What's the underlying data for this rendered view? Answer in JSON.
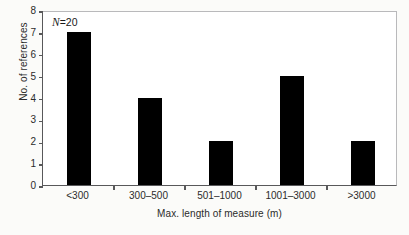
{
  "chart_data": {
    "type": "bar",
    "title": "",
    "subtitle": "",
    "categories": [
      "<300",
      "300–500",
      "501–1000",
      "1001–3000",
      ">3000"
    ],
    "values": [
      7,
      4,
      2,
      5,
      2
    ],
    "series": [
      {
        "name": "No. of references",
        "values": [
          7,
          4,
          2,
          5,
          2
        ]
      }
    ],
    "xlabel": "Max. length of measure (m)",
    "ylabel": "No. of references",
    "ylim": [
      0,
      8
    ],
    "yticks": [
      0,
      1,
      2,
      3,
      4,
      5,
      6,
      7,
      8
    ],
    "ytick_labels": [
      "0",
      "1",
      "2",
      "3",
      "4",
      "5",
      "6",
      "7",
      "8"
    ],
    "grid": false,
    "legend": false,
    "legend_position": "none",
    "annotations": [
      {
        "name": "sample-size",
        "symbol": "N",
        "equals": "=",
        "value": "20",
        "text": "N = 20",
        "position": "top-left-inside"
      }
    ],
    "colors": {
      "bar_fill": "#000000",
      "axis": "#58585a",
      "frame_light": "#b9b9bb",
      "plot_background": "#ffffff",
      "figure_background": "#fbfbf9",
      "text": "#2b2b2b"
    }
  }
}
